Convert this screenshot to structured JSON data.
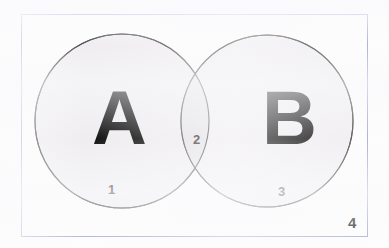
{
  "figure": {
    "type": "venn-diagram",
    "title": "",
    "background_color": "#fdfdfd"
  },
  "universe": {
    "name": "universal-set-rectangle",
    "border_color": "#a9aed8",
    "label": "4"
  },
  "sets": [
    {
      "id": "A",
      "letter": "A",
      "fill_color": "#efedef",
      "stroke_color": "#4a4a4a",
      "cx": 122,
      "cy": 121,
      "r": 87
    },
    {
      "id": "B",
      "letter": "B",
      "fill_color": "#efedef",
      "stroke_color": "#4a4a4a",
      "cx": 267,
      "cy": 121,
      "r": 86
    }
  ],
  "regions": [
    {
      "id": "region-1",
      "label": "1",
      "meaning": "A only"
    },
    {
      "id": "region-2",
      "label": "2",
      "meaning": "A and B intersection"
    },
    {
      "id": "region-3",
      "label": "3",
      "meaning": "B only"
    },
    {
      "id": "region-4",
      "label": "4",
      "meaning": "outside both sets"
    }
  ],
  "colors": {
    "circle_fill": "#efedef",
    "intersection_fill": "#e7e5e8",
    "circle_stroke": "#4a4a4a",
    "rect_stroke": "#a9aed8",
    "text": "#0d0d0d",
    "number_text": "#2a2420"
  }
}
